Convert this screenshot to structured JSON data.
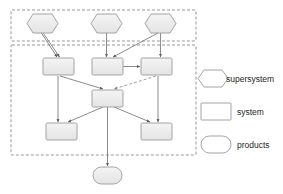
{
  "diagram": {
    "colors": {
      "shape_fill": "#ebebeb",
      "shape_fill_light": "#f2f2f2",
      "shape_stroke": "#9a9a9a",
      "container_stroke": "#8c8c8c",
      "connector_stroke": "#6e6e6e",
      "legend_box_fill": "#ffffff",
      "text": "#231f20",
      "background": "#ffffff"
    },
    "containers": [
      {
        "id": "supersystem-container",
        "name": "supersystem layer",
        "x": 11,
        "y": 10,
        "width": 185,
        "height": 31
      },
      {
        "id": "system-container",
        "name": "system layer",
        "x": 11,
        "y": 45,
        "width": 185,
        "height": 110
      }
    ],
    "nodes": [
      {
        "id": "supersystem-1",
        "type": "supersystem",
        "shape": "hexagon",
        "label": "",
        "x": 27,
        "y": 14,
        "width": 31,
        "height": 19
      },
      {
        "id": "supersystem-2",
        "type": "supersystem",
        "shape": "hexagon",
        "label": "",
        "x": 91,
        "y": 14,
        "width": 31,
        "height": 19
      },
      {
        "id": "supersystem-3",
        "type": "supersystem",
        "shape": "hexagon",
        "label": "",
        "x": 145,
        "y": 14,
        "width": 31,
        "height": 19
      },
      {
        "id": "system-1",
        "type": "system",
        "shape": "rect",
        "label": "",
        "x": 43,
        "y": 58,
        "width": 31,
        "height": 17
      },
      {
        "id": "system-2",
        "type": "system",
        "shape": "rect",
        "label": "",
        "x": 92,
        "y": 58,
        "width": 31,
        "height": 17
      },
      {
        "id": "system-3",
        "type": "system",
        "shape": "rect",
        "label": "",
        "x": 141,
        "y": 58,
        "width": 31,
        "height": 17
      },
      {
        "id": "system-center",
        "type": "system",
        "shape": "rect",
        "label": "",
        "x": 92,
        "y": 90,
        "width": 31,
        "height": 17
      },
      {
        "id": "system-4",
        "type": "system",
        "shape": "rect",
        "label": "",
        "x": 46,
        "y": 123,
        "width": 31,
        "height": 17
      },
      {
        "id": "system-5",
        "type": "system",
        "shape": "rect",
        "label": "",
        "x": 141,
        "y": 123,
        "width": 31,
        "height": 17
      },
      {
        "id": "product-1",
        "type": "products",
        "shape": "stadium",
        "label": "",
        "x": 93,
        "y": 167,
        "width": 29,
        "height": 17
      }
    ],
    "connectors": [
      {
        "id": "c1",
        "from": "supersystem-1",
        "to": "system-1",
        "style": "solid",
        "arrow": true
      },
      {
        "id": "c2",
        "from": "supersystem-1",
        "to": "system-1-alt",
        "style": "solid",
        "arrow": true
      },
      {
        "id": "c3",
        "from": "supersystem-2",
        "to": "system-2",
        "style": "solid",
        "arrow": true
      },
      {
        "id": "c4",
        "from": "supersystem-3",
        "to": "system-2",
        "style": "solid",
        "arrow": true
      },
      {
        "id": "c5",
        "from": "supersystem-3",
        "to": "system-3",
        "style": "solid",
        "arrow": true
      },
      {
        "id": "c6",
        "from": "system-2",
        "to": "system-3",
        "style": "solid",
        "arrow": true
      },
      {
        "id": "c7",
        "from": "system-1",
        "to": "system-center",
        "style": "solid",
        "arrow": true
      },
      {
        "id": "c8",
        "from": "system-3",
        "to": "system-center",
        "style": "dashed",
        "arrow": true
      },
      {
        "id": "c9",
        "from": "system-1",
        "to": "system-4",
        "style": "solid",
        "arrow": true
      },
      {
        "id": "c10",
        "from": "system-3",
        "to": "system-5",
        "style": "solid",
        "arrow": true
      },
      {
        "id": "c11",
        "from": "system-center",
        "to": "system-4",
        "style": "solid",
        "arrow": true
      },
      {
        "id": "c12",
        "from": "system-center",
        "to": "system-5",
        "style": "solid",
        "arrow": true
      },
      {
        "id": "c13",
        "from": "system-center",
        "to": "product-1",
        "style": "solid",
        "arrow": true
      }
    ]
  },
  "legend": {
    "items": [
      {
        "id": "legend-supersystem",
        "shape": "hexagon",
        "label": "supersystem",
        "x": 198,
        "y": 70,
        "width": 30,
        "height": 17
      },
      {
        "id": "legend-system",
        "shape": "rect",
        "label": "system",
        "x": 201,
        "y": 103,
        "width": 30,
        "height": 17
      },
      {
        "id": "legend-products",
        "shape": "stadium",
        "label": "products",
        "x": 201,
        "y": 136,
        "width": 30,
        "height": 17
      }
    ]
  }
}
